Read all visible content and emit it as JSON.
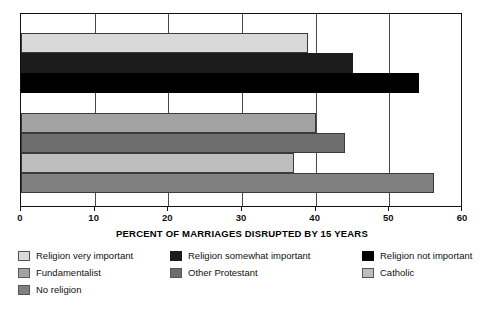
{
  "chart_data": {
    "type": "bar",
    "orientation": "horizontal",
    "title": "",
    "xlabel": "PERCENT OF MARRIAGES DISRUPTED BY 15 YEARS",
    "ylabel": "",
    "xlim": [
      0,
      60
    ],
    "xticks": [
      "0",
      "10",
      "20",
      "30",
      "40",
      "50",
      "60"
    ],
    "xtick_values": [
      0,
      10,
      20,
      30,
      40,
      50,
      60
    ],
    "grid": true,
    "grid_axis": "x",
    "legend_position": "below",
    "categories": [
      "Religion very important",
      "Religion somewhat important",
      "Religion not important",
      "Fundamentalist",
      "Other Protestant",
      "Catholic",
      "No religion"
    ],
    "values": [
      39,
      45,
      54,
      40,
      44,
      37,
      56
    ],
    "colors": [
      "#d9d9d9",
      "#1c1c1c",
      "#000000",
      "#a3a3a3",
      "#6e6e6e",
      "#bdbdbd",
      "#808080"
    ],
    "bars": [
      {
        "label": "Religion very important",
        "value": 39,
        "color": "#d9d9d9",
        "group": "religion-importance"
      },
      {
        "label": "Religion somewhat important",
        "value": 45,
        "color": "#1c1c1c",
        "group": "religion-importance"
      },
      {
        "label": "Religion not important",
        "value": 54,
        "color": "#000000",
        "group": "religion-importance"
      },
      {
        "label": "Fundamentalist",
        "value": 40,
        "color": "#a3a3a3",
        "group": "denomination"
      },
      {
        "label": "Other Protestant",
        "value": 44,
        "color": "#6e6e6e",
        "group": "denomination"
      },
      {
        "label": "Catholic",
        "value": 37,
        "color": "#bdbdbd",
        "group": "denomination"
      },
      {
        "label": "No religion",
        "value": 56,
        "color": "#808080",
        "group": "denomination"
      }
    ]
  },
  "axis": {
    "x_title": "PERCENT OF MARRIAGES DISRUPTED BY 15 YEARS",
    "ticks": [
      {
        "label": "0",
        "value": 0
      },
      {
        "label": "10",
        "value": 10
      },
      {
        "label": "20",
        "value": 20
      },
      {
        "label": "30",
        "value": 30
      },
      {
        "label": "40",
        "value": 40
      },
      {
        "label": "50",
        "value": 50
      },
      {
        "label": "60",
        "value": 60
      }
    ]
  },
  "legend": {
    "columns": 3,
    "items": [
      {
        "label": "Religion very important",
        "color": "#d9d9d9",
        "col": 0,
        "row": 0
      },
      {
        "label": "Fundamentalist",
        "color": "#a3a3a3",
        "col": 0,
        "row": 1
      },
      {
        "label": "No religion",
        "color": "#808080",
        "col": 0,
        "row": 2
      },
      {
        "label": "Religion somewhat important",
        "color": "#1c1c1c",
        "col": 1,
        "row": 0
      },
      {
        "label": "Other Protestant",
        "color": "#6e6e6e",
        "col": 1,
        "row": 1
      },
      {
        "label": "Religion not important",
        "color": "#000000",
        "col": 2,
        "row": 0
      },
      {
        "label": "Catholic",
        "color": "#bdbdbd",
        "col": 2,
        "row": 1
      }
    ]
  }
}
